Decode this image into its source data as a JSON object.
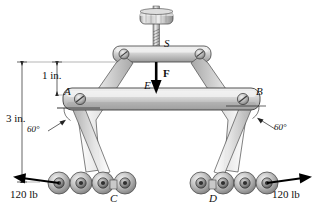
{
  "figure": {
    "dimensions": {
      "upper": "1 in.",
      "overall": "3 in."
    },
    "angles": {
      "left": "60°",
      "right": "60°"
    },
    "points": {
      "screw": "S",
      "force": "F",
      "force_point": "E",
      "pivot_left": "A",
      "pivot_right": "B",
      "chain_left": "C",
      "chain_right": "D"
    },
    "loads": {
      "left": "120 lb",
      "right": "120 lb"
    },
    "colors": {
      "metal_light": "#dcdcdc",
      "metal_mid": "#c0c0c0",
      "metal_dark": "#8f8f8f",
      "outline": "#3a3a3a",
      "arrow": "#000000",
      "background": "#ffffff"
    },
    "counts": {
      "rollers_left": 4,
      "rollers_right": 4
    }
  }
}
